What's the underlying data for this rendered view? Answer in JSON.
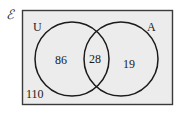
{
  "universal_symbol": "ℰ",
  "sets": [
    {
      "name": "U",
      "label": "U"
    },
    {
      "name": "A",
      "label": "A"
    }
  ],
  "regions": {
    "only_U": "86",
    "both": "28",
    "only_A": "19",
    "outside": "110"
  },
  "colors": {
    "box_fill": "#ececec",
    "stroke": "#1a1a1a",
    "page": "#ffffff"
  }
}
